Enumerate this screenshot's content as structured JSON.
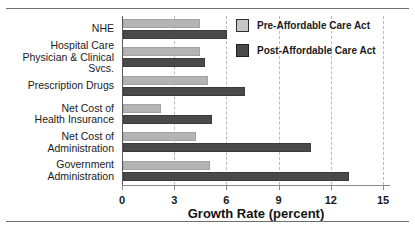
{
  "chart_data": {
    "type": "bar",
    "orientation": "horizontal",
    "title": "",
    "xlabel": "Growth Rate (percent)",
    "ylabel": "",
    "xlim": [
      0,
      15
    ],
    "xticks": [
      "0",
      "3",
      "6",
      "9",
      "12",
      "15"
    ],
    "grid": "vertical-dashed",
    "legend_position": "top-right",
    "categories": [
      "NHE",
      "Hospital Care\nPhysician & Clinical Svcs.",
      "Prescription Drugs",
      "Net Cost of\nHealth Insurance",
      "Net Cost of Administration",
      "Government\nAdministration"
    ],
    "series": [
      {
        "name": "Pre-Affordable Care Act",
        "color": "#b4b4b4",
        "values": [
          4.4,
          4.4,
          4.9,
          2.2,
          4.2,
          5.0
        ]
      },
      {
        "name": "Post-Affordable Care Act",
        "color": "#4a4a4a",
        "values": [
          6.0,
          4.7,
          7.0,
          5.1,
          10.8,
          13.0
        ]
      }
    ]
  }
}
